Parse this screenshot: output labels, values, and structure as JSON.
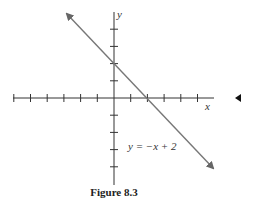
{
  "chart_data": {
    "type": "line",
    "title": "",
    "caption": "Figure 8.3",
    "xlabel": "x",
    "ylabel": "y",
    "equation_label": "y = −x + 2",
    "series": [
      {
        "name": "y = -x + 2",
        "x": [
          -3,
          6
        ],
        "y": [
          5,
          -4
        ]
      }
    ],
    "x_ticks": [
      -6,
      -5,
      -4,
      -3,
      -2,
      -1,
      1,
      2,
      3,
      4,
      5
    ],
    "y_ticks": [
      -4,
      -3,
      -2,
      -1,
      1,
      2,
      3,
      4
    ],
    "xlim": [
      -6,
      6
    ],
    "ylim": [
      -5,
      5
    ],
    "intercepts": {
      "x": 2,
      "y": 2
    },
    "grid": false,
    "arrows": true,
    "colors": {
      "line": "#777777",
      "axis": "#333333"
    }
  },
  "figure": {
    "caption": "Figure 8.3",
    "x_label": "x",
    "y_label": "y",
    "equation": "y = −x + 2"
  }
}
